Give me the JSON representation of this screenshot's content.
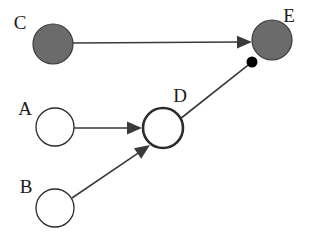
{
  "diagram": {
    "canvas": {
      "width": 310,
      "height": 243,
      "background": "#ffffff"
    },
    "colors": {
      "filled_node_fill": "#6b6b6b",
      "filled_node_stroke": "#3a3a3a",
      "open_node_fill": "#ffffff",
      "open_node_stroke": "#2b2b2b",
      "edge_stroke": "#3a3a3a",
      "label_color": "#1a1a1a",
      "ball_terminator_fill": "#000000"
    },
    "nodes": [
      {
        "id": "C",
        "label": "C",
        "style": "filled",
        "cx": 53,
        "cy": 44,
        "r": 20,
        "stroke_width": 1.2,
        "label_x": 20,
        "label_y": 25
      },
      {
        "id": "E",
        "label": "E",
        "style": "filled",
        "cx": 272,
        "cy": 40,
        "r": 20,
        "stroke_width": 1.2,
        "label_x": 289,
        "label_y": 18
      },
      {
        "id": "A",
        "label": "A",
        "style": "open",
        "cx": 55,
        "cy": 127,
        "r": 19,
        "stroke_width": 1.3,
        "label_x": 25,
        "label_y": 111
      },
      {
        "id": "D",
        "label": "D",
        "style": "open-bold",
        "cx": 163,
        "cy": 128,
        "r": 20,
        "stroke_width": 2.6,
        "label_x": 180,
        "label_y": 98
      },
      {
        "id": "B",
        "label": "B",
        "style": "open",
        "cx": 55,
        "cy": 208,
        "r": 19,
        "stroke_width": 1.3,
        "label_x": 26,
        "label_y": 189
      }
    ],
    "edges": [
      {
        "id": "C-E",
        "source": "C",
        "target": "E",
        "terminator": "arrow",
        "x1": 73,
        "y1": 43,
        "x2": 252,
        "y2": 42,
        "stroke_width": 1.6
      },
      {
        "id": "A-D",
        "source": "A",
        "target": "D",
        "terminator": "arrow",
        "x1": 74,
        "y1": 128,
        "x2": 142,
        "y2": 128,
        "stroke_width": 1.6
      },
      {
        "id": "B-D",
        "source": "B",
        "target": "D",
        "terminator": "arrow",
        "x1": 72,
        "y1": 198,
        "x2": 150,
        "y2": 145,
        "stroke_width": 1.6
      },
      {
        "id": "D-E",
        "source": "D",
        "target": "E",
        "terminator": "ball",
        "x1": 180,
        "y1": 119,
        "x2": 252,
        "y2": 62,
        "stroke_width": 1.6,
        "ball_r": 5.5
      }
    ]
  }
}
